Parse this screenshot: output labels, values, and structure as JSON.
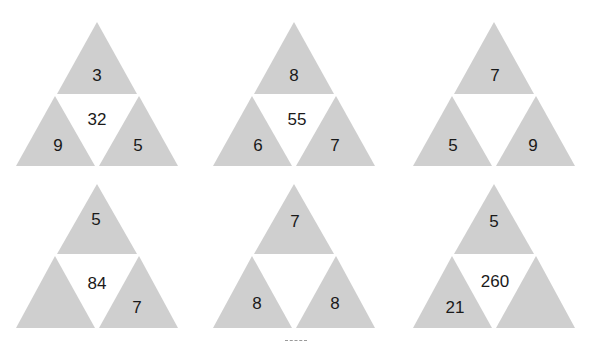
{
  "colors": {
    "triangle_fill": "#cfcfcf",
    "center_fill": "#ffffff",
    "text": "#1a1a1a"
  },
  "puzzles": [
    {
      "top": "3",
      "left": "9",
      "right": "5",
      "center": "32"
    },
    {
      "top": "8",
      "left": "6",
      "right": "7",
      "center": "55"
    },
    {
      "top": "7",
      "left": "5",
      "right": "9",
      "center": ""
    },
    {
      "top": "5",
      "left": "",
      "right": "7",
      "center": "84"
    },
    {
      "top": "7",
      "left": "8",
      "right": "8",
      "center": ""
    },
    {
      "top": "5",
      "left": "21",
      "right": "",
      "center": "260"
    }
  ]
}
